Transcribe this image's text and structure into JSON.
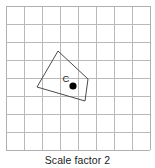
{
  "figure": {
    "caption": "Scale factor 2",
    "point_label": "C",
    "colors": {
      "grid_line": "#b9b9b9",
      "grid_border": "#b0b0b0",
      "shape_stroke": "#4a4a4a",
      "point_fill": "#000000",
      "label_text": "#1a1a1a",
      "background": "#ffffff"
    }
  },
  "chart_data": {
    "type": "diagram",
    "title": "Scale factor 2",
    "grid": {
      "origin_x": 6,
      "origin_y": 6,
      "cell_size": 18,
      "columns": 8,
      "rows": 8,
      "width": 144,
      "height": 144,
      "visible": true
    },
    "shapes": [
      {
        "name": "quadrilateral",
        "type": "polygon",
        "vertices": [
          [
            58,
            51
          ],
          [
            88,
            79
          ],
          [
            85,
            101
          ],
          [
            37,
            87
          ]
        ],
        "fill": "none",
        "stroke": "#4a4a4a",
        "stroke_width": 1
      }
    ],
    "points": [
      {
        "name": "center-of-enlargement",
        "label": "C",
        "x": 73,
        "y": 86,
        "radius": 3.6,
        "label_x": 66,
        "label_y": 82
      }
    ],
    "annotations": [
      {
        "name": "caption",
        "text": "Scale factor 2",
        "x": 77,
        "y": 162
      }
    ]
  }
}
